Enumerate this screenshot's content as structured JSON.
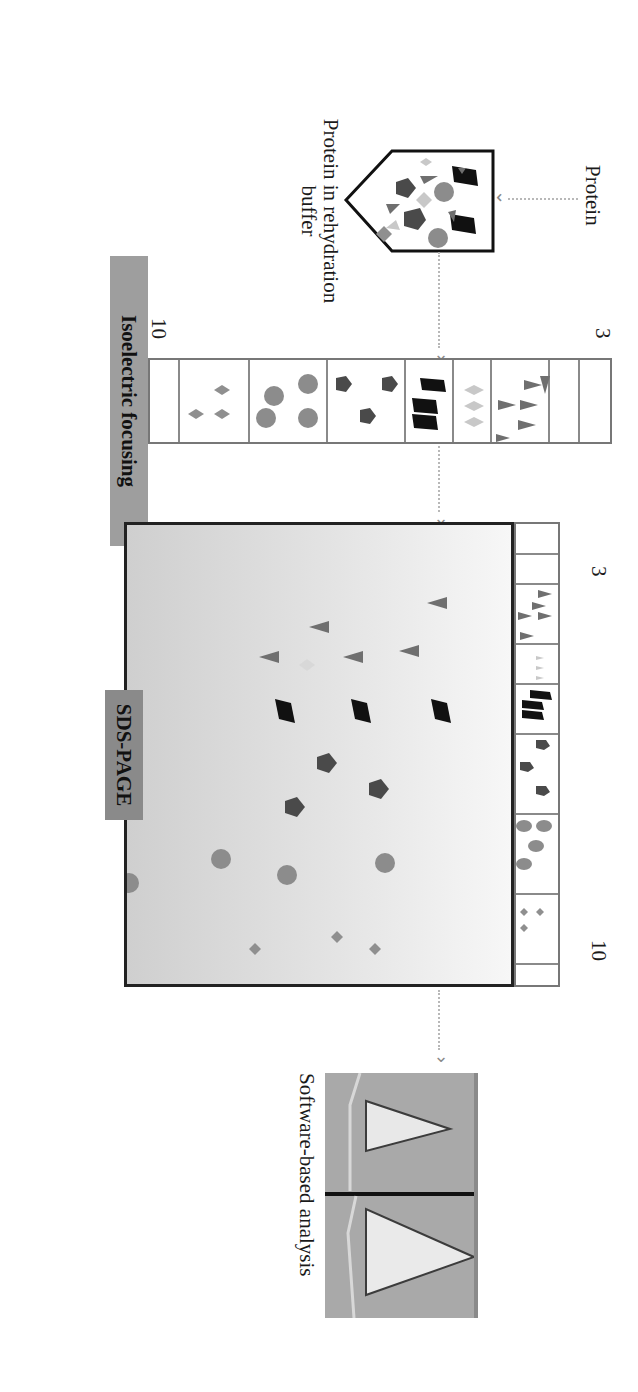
{
  "diagram": {
    "steps": [
      {
        "id": "protein",
        "label": "Protein"
      },
      {
        "id": "rehydration",
        "label_line1": "Protein in rehydration",
        "label_line2": "buffer"
      },
      {
        "id": "ief",
        "label": "Isoelectric focusing",
        "ph_start": "3",
        "ph_end": "10"
      },
      {
        "id": "sds",
        "label": "SDS-PAGE",
        "ph_start": "3",
        "ph_end": "10"
      },
      {
        "id": "analysis",
        "label": "Software-based analysis"
      }
    ],
    "colors": {
      "banner_ief": "#9e9e9e",
      "banner_sds": "#8a8a8a",
      "triangle": "#6f6f6f",
      "diamond_light": "#c8c8c8",
      "rhombus": "#111111",
      "pentagon": "#4a4a4a",
      "circle": "#8c8c8c",
      "diamond_small": "#8f8f8f",
      "connector": "#b8b8b8"
    },
    "protein_classes": [
      "triangle",
      "light-diamond",
      "black-rhombus",
      "pentagon",
      "circle",
      "small-diamond"
    ]
  }
}
